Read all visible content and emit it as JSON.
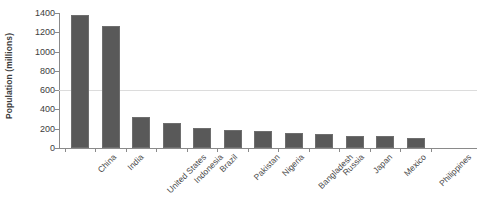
{
  "chart_data": {
    "type": "bar",
    "title": "",
    "xlabel": "",
    "ylabel": "Population (millions)",
    "ylim": [
      0,
      1400
    ],
    "yticks": [
      0,
      200,
      400,
      600,
      800,
      1000,
      1200,
      1400
    ],
    "ytick_labels": [
      "0",
      "200",
      "400",
      "600",
      "800",
      "1000",
      "1200",
      "1400"
    ],
    "grid": "single horizontal gridline at 600",
    "gridlines": [
      600
    ],
    "legend": "none",
    "bar_color": "#595959",
    "axis_color": "#8a8a8a",
    "gridline_color": "#dcdcdc",
    "categories": [
      "China",
      "India",
      "United States",
      "Indonesia",
      "Brazil",
      "Pakistan",
      "Nigeria",
      "Bangladesh",
      "Russia",
      "Japan",
      "Mexico",
      "Philippines"
    ],
    "values": [
      1380,
      1270,
      320,
      255,
      205,
      190,
      180,
      160,
      145,
      125,
      125,
      105
    ]
  }
}
